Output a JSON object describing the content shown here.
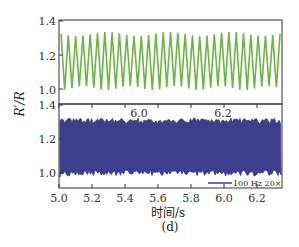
{
  "chart_data": [
    {
      "type": "line",
      "panel": "top",
      "title": "",
      "xlabel": "",
      "ylabel": "R'/R",
      "x_ticks": [
        "6.0",
        "6.2"
      ],
      "y_ticks": [
        "1.0",
        "1.2",
        "1.4"
      ],
      "ylim": [
        0.95,
        1.4
      ],
      "series": [
        {
          "name": "zoomed 20×",
          "color": "#6cb543",
          "description": "periodic oscillation between ~1.0 and ~1.3"
        }
      ]
    },
    {
      "type": "line",
      "panel": "bottom",
      "xlabel": "时间/s",
      "ylabel": "R'/R",
      "x_ticks": [
        "5.0",
        "5.2",
        "5.4",
        "5.6",
        "5.8",
        "6.0",
        "6.2"
      ],
      "xlim": [
        5.0,
        6.35
      ],
      "y_ticks": [
        "1.0",
        "1.2",
        "1.4"
      ],
      "ylim": [
        0.95,
        1.4
      ],
      "legend": [
        {
          "label": "100 Hz  20×",
          "color": "#3b3d8a"
        }
      ],
      "series": [
        {
          "name": "100 Hz",
          "color": "#3b3d8a",
          "description": "dense oscillation between ~1.0 and ~1.3"
        }
      ]
    }
  ],
  "labels": {
    "ylabel": "R′/R",
    "xlabel": "时间/s",
    "panel": "(d)",
    "legend": "100 Hz  20×",
    "top_x_ticks": [
      "6.0",
      "6.2"
    ],
    "y_ticks": [
      "1.4",
      "1.2",
      "1.0"
    ],
    "bottom_x_ticks": [
      "5.0",
      "5.2",
      "5.4",
      "5.6",
      "5.8",
      "6.0",
      "6.2"
    ]
  }
}
